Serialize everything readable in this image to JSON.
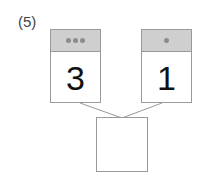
{
  "problem": {
    "label": "(5)",
    "cards": [
      {
        "dots": 3,
        "number": "3"
      },
      {
        "dots": 1,
        "number": "1"
      }
    ],
    "answer_box": {
      "value": ""
    }
  },
  "colors": {
    "header": "#cfcfcf",
    "dot": "#8c8c8c",
    "border": "#9a9a9a"
  }
}
